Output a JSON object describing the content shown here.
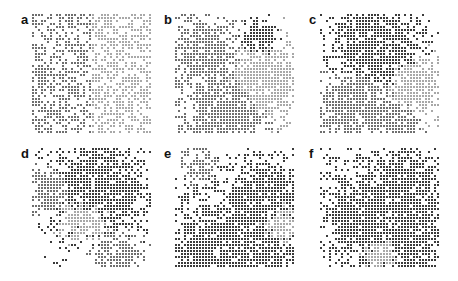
{
  "figure": {
    "grid_size": 40,
    "cell_pitch_px": 3,
    "cell_size_px": 2,
    "colors": {
      "dark": "#3a3a3a",
      "mid": "#6e6e6e",
      "light": "#a8a8a8",
      "empty": "#ffffff"
    },
    "panels": [
      {
        "label": "a",
        "x": 32,
        "y": 14,
        "seed": 11,
        "mode": "split",
        "fill": 0.55
      },
      {
        "label": "b",
        "x": 175,
        "y": 14,
        "seed": 23,
        "mode": "clusters",
        "fill": 0.55,
        "blobs": [
          {
            "cx": 0.4,
            "cy": 0.8,
            "r": 0.28,
            "c": "mid"
          },
          {
            "cx": 0.75,
            "cy": 0.55,
            "r": 0.25,
            "c": "light"
          },
          {
            "cx": 0.25,
            "cy": 0.3,
            "r": 0.22,
            "c": "mid"
          },
          {
            "cx": 0.7,
            "cy": 0.2,
            "r": 0.12,
            "c": "dark"
          }
        ]
      },
      {
        "label": "c",
        "x": 320,
        "y": 14,
        "seed": 37,
        "mode": "clusters",
        "fill": 0.55,
        "blobs": [
          {
            "cx": 0.45,
            "cy": 0.25,
            "r": 0.3,
            "c": "dark"
          },
          {
            "cx": 0.3,
            "cy": 0.75,
            "r": 0.25,
            "c": "mid"
          },
          {
            "cx": 0.8,
            "cy": 0.6,
            "r": 0.2,
            "c": "light"
          },
          {
            "cx": 0.65,
            "cy": 0.9,
            "r": 0.15,
            "c": "mid"
          }
        ]
      },
      {
        "label": "d",
        "x": 32,
        "y": 148,
        "seed": 41,
        "mode": "clusters",
        "fill": 0.5,
        "blobs": [
          {
            "cx": 0.55,
            "cy": 0.35,
            "r": 0.32,
            "c": "dark"
          },
          {
            "cx": 0.15,
            "cy": 0.35,
            "r": 0.15,
            "c": "mid"
          },
          {
            "cx": 0.45,
            "cy": 0.55,
            "r": 0.18,
            "c": "light"
          },
          {
            "cx": 0.7,
            "cy": 0.85,
            "r": 0.15,
            "c": "mid"
          }
        ]
      },
      {
        "label": "e",
        "x": 175,
        "y": 148,
        "seed": 53,
        "mode": "clusters",
        "fill": 0.5,
        "blobs": [
          {
            "cx": 0.5,
            "cy": 0.9,
            "r": 0.45,
            "c": "dark"
          },
          {
            "cx": 0.75,
            "cy": 0.45,
            "r": 0.3,
            "c": "dark"
          },
          {
            "cx": 0.85,
            "cy": 0.6,
            "r": 0.18,
            "c": "light"
          },
          {
            "cx": 0.2,
            "cy": 0.15,
            "r": 0.1,
            "c": "mid"
          }
        ]
      },
      {
        "label": "f",
        "x": 320,
        "y": 148,
        "seed": 67,
        "mode": "clusters",
        "fill": 0.5,
        "blobs": [
          {
            "cx": 0.6,
            "cy": 0.6,
            "r": 0.42,
            "c": "dark"
          },
          {
            "cx": 0.3,
            "cy": 0.55,
            "r": 0.22,
            "c": "dark"
          },
          {
            "cx": 0.5,
            "cy": 0.85,
            "r": 0.15,
            "c": "light"
          },
          {
            "cx": 0.75,
            "cy": 0.2,
            "r": 0.18,
            "c": "dark"
          }
        ]
      }
    ]
  }
}
